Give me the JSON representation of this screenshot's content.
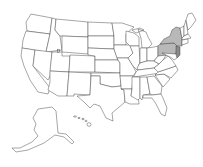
{
  "map": {
    "type": "choropleth",
    "region": "United States",
    "colors": {
      "background": "#ffffff",
      "default_fill": "#ffffff",
      "border": "#3a3a3a",
      "highlight": "#b8b8b8",
      "highlight_dark": "#8a8a8a"
    },
    "highlighted_states": [
      {
        "name": "New York",
        "shade": "highlight"
      },
      {
        "name": "Pennsylvania",
        "shade": "highlight"
      },
      {
        "name": "New Jersey",
        "shade": "highlight_dark"
      }
    ],
    "insets": [
      "Alaska",
      "Hawaii"
    ]
  }
}
